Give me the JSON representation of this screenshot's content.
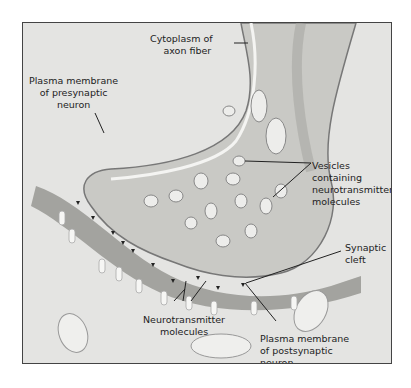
{
  "diagram": {
    "title": "",
    "labels": {
      "cytoplasm": [
        "Cytoplasm of",
        "axon fiber"
      ],
      "pre_membrane": [
        "Plasma membrane",
        "of presynaptic",
        "neuron"
      ],
      "vesicles": [
        "Vesicles",
        "containing",
        "neurotransmitter",
        "molecules"
      ],
      "cleft": [
        "Synaptic",
        "cleft"
      ],
      "nt_molecules": [
        "Neurotransmitter",
        "molecules"
      ],
      "post_membrane": [
        "Plasma membrane",
        "of postsynaptic",
        "neuron"
      ]
    },
    "colors": {
      "background": "#e6e6e4",
      "terminal": "#cfcfcc",
      "cleft": "#9a9a96",
      "line": "#222222"
    }
  }
}
